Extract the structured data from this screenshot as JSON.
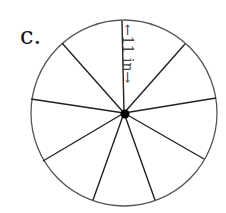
{
  "figure": {
    "label": "c.",
    "dimension_label": "←11 in→",
    "dimension_value": "11 in",
    "shape": "circle divided into 9 sectors",
    "sectors": 9,
    "stroke_color": "#222222",
    "circle_color": "#555555"
  }
}
